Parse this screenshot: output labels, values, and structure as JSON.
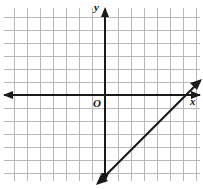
{
  "figure": {
    "width": 203,
    "height": 189,
    "background": "#ffffff"
  },
  "labels": {
    "y_axis": "y",
    "x_axis": "x",
    "origin": "O"
  },
  "colors": {
    "grid": "#b8b8b8",
    "axis": "#1a1a1a",
    "line": "#1a1a1a",
    "background": "#ffffff"
  },
  "chart_data": {
    "type": "line",
    "title": "",
    "xlabel": "x",
    "ylabel": "y",
    "origin_label": "O",
    "grid": true,
    "grid_spacing_px": 13,
    "axis_arrows": [
      "left",
      "up",
      "right",
      "down"
    ],
    "xlim": [
      -8,
      7.5
    ],
    "ylim": [
      -6.5,
      6.7
    ],
    "series": [
      {
        "name": "line",
        "slope": 1,
        "y_intercept": -6,
        "equation": "y = x - 6",
        "points": [
          {
            "x": 0,
            "y": -6
          },
          {
            "x": 6,
            "y": 0
          }
        ],
        "endpoints_px": [
          {
            "x": 104,
            "y": 177
          },
          {
            "x": 196,
            "y": 85
          }
        ]
      }
    ],
    "axes_px": {
      "x_axis_y": 95,
      "y_axis_x": 105,
      "grid_left": 4,
      "grid_top": 8,
      "grid_right": 200,
      "grid_bottom": 181
    }
  }
}
